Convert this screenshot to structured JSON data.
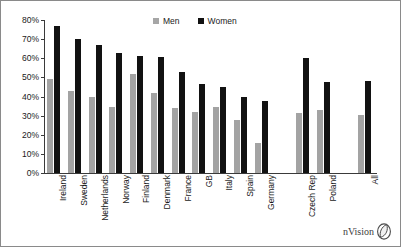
{
  "chart_data": {
    "type": "bar",
    "title": "",
    "subtitle": "",
    "xlabel": "",
    "ylabel": "",
    "ylim": [
      0,
      80
    ],
    "ytick_labels": [
      "0%",
      "10%",
      "20%",
      "30%",
      "40%",
      "50%",
      "60%",
      "70%",
      "80%"
    ],
    "ytick_values": [
      0,
      10,
      20,
      30,
      40,
      50,
      60,
      70,
      80
    ],
    "grid": false,
    "legend_position": "top-center",
    "categories": [
      "Ireland",
      "Sweden",
      "Netherlands",
      "Norway",
      "Finland",
      "Denmark",
      "France",
      "GB",
      "Italy",
      "Spain",
      "Germany",
      "",
      "Czech Rep",
      "Poland",
      "",
      "All"
    ],
    "series": [
      {
        "name": "Men",
        "color": "#a3a3a3",
        "values": [
          49,
          43,
          40,
          34.5,
          52,
          42,
          34,
          32,
          34.5,
          27.5,
          15.5,
          null,
          31.5,
          33,
          null,
          30.5
        ]
      },
      {
        "name": "Women",
        "color": "#121212",
        "values": [
          77,
          70,
          67,
          63,
          61,
          60.5,
          53,
          46.5,
          45,
          40,
          37.5,
          null,
          60,
          47.5,
          null,
          48
        ]
      }
    ]
  },
  "legend": {
    "entries": [
      {
        "label": "Men",
        "swatch": "men-swatch-icon"
      },
      {
        "label": "Women",
        "swatch": "women-swatch-icon"
      }
    ]
  },
  "watermark": {
    "text": "nVision",
    "logo": "nvision-leaf-logo-icon"
  }
}
